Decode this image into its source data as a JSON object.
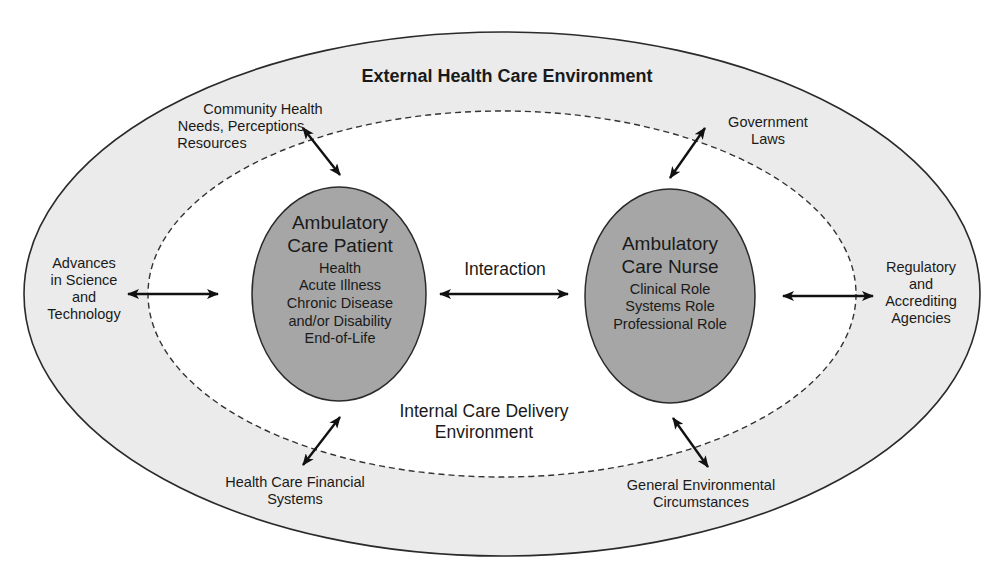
{
  "diagram": {
    "title": "External Health Care Environment",
    "inner_environment": {
      "line1": "Internal Care Delivery",
      "line2": "Environment"
    },
    "interaction_label": "Interaction",
    "patient": {
      "title_line1": "Ambulatory",
      "title_line2": "Care Patient",
      "items": [
        "Health",
        "Acute Illness",
        "Chronic Disease",
        "and/or Disability",
        "End-of-Life"
      ]
    },
    "nurse": {
      "title_line1": "Ambulatory",
      "title_line2": "Care Nurse",
      "items": [
        "Clinical Role",
        "Systems Role",
        "Professional Role"
      ]
    },
    "external_factors": {
      "community": [
        "Community Health",
        "Needs, Perceptions,",
        "Resources"
      ],
      "government": [
        "Government",
        "Laws"
      ],
      "advances": [
        "Advances",
        "in Science",
        "and",
        "Technology"
      ],
      "regulatory": [
        "Regulatory",
        "and",
        "Accrediting",
        "Agencies"
      ],
      "financial": [
        "Health Care Financial",
        "Systems"
      ],
      "general": [
        "General Environmental",
        "Circumstances"
      ]
    },
    "colors": {
      "outer_fill": "#ebebeb",
      "inner_fill": "#ffffff",
      "oval_fill": "#a6a6a6",
      "stroke": "#2a2a2a",
      "arrow": "#111111"
    }
  }
}
